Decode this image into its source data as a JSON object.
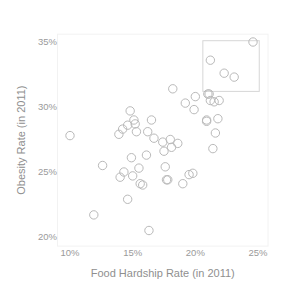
{
  "chart_data": {
    "type": "scatter",
    "title": "",
    "xlabel": "Food Hardship Rate (in 2011)",
    "ylabel": "Obesity Rate (in 2011)",
    "xlim": [
      9.0,
      25.8
    ],
    "ylim": [
      19.3,
      35.6
    ],
    "xticks": [
      10,
      15,
      20,
      25
    ],
    "xtick_labels": [
      "10%",
      "15%",
      "20%",
      "25%"
    ],
    "yticks": [
      20,
      25,
      30,
      35
    ],
    "ytick_labels": [
      "20%",
      "25%",
      "30%",
      "35%"
    ],
    "grid": false,
    "legend": null,
    "marker": {
      "shape": "open-circle",
      "color": "#b9b9b9",
      "size": 4.2
    },
    "annotations": [
      {
        "kind": "rectangle",
        "name": "highlight-box",
        "x0": 20.6,
        "x1": 25.1,
        "y0": 31.2,
        "y1": 35.1,
        "color": "#d6d6d6"
      }
    ],
    "points": [
      {
        "x": 10.0,
        "y": 27.8
      },
      {
        "x": 11.9,
        "y": 21.7
      },
      {
        "x": 12.6,
        "y": 25.5
      },
      {
        "x": 13.9,
        "y": 27.9
      },
      {
        "x": 14.0,
        "y": 24.6
      },
      {
        "x": 14.2,
        "y": 28.3
      },
      {
        "x": 14.3,
        "y": 25.0
      },
      {
        "x": 14.6,
        "y": 28.6
      },
      {
        "x": 14.6,
        "y": 22.9
      },
      {
        "x": 14.8,
        "y": 29.7
      },
      {
        "x": 14.9,
        "y": 26.1
      },
      {
        "x": 15.0,
        "y": 24.7
      },
      {
        "x": 15.1,
        "y": 29.0
      },
      {
        "x": 15.2,
        "y": 28.7
      },
      {
        "x": 15.3,
        "y": 28.1
      },
      {
        "x": 15.5,
        "y": 25.3
      },
      {
        "x": 15.6,
        "y": 24.1
      },
      {
        "x": 15.8,
        "y": 24.0
      },
      {
        "x": 16.1,
        "y": 26.3
      },
      {
        "x": 16.2,
        "y": 28.1
      },
      {
        "x": 16.3,
        "y": 20.5
      },
      {
        "x": 16.5,
        "y": 29.0
      },
      {
        "x": 16.7,
        "y": 27.6
      },
      {
        "x": 17.4,
        "y": 27.3
      },
      {
        "x": 17.5,
        "y": 26.6
      },
      {
        "x": 17.6,
        "y": 25.4
      },
      {
        "x": 17.7,
        "y": 24.4
      },
      {
        "x": 17.8,
        "y": 24.4
      },
      {
        "x": 18.0,
        "y": 27.5
      },
      {
        "x": 18.1,
        "y": 26.9
      },
      {
        "x": 18.2,
        "y": 31.4
      },
      {
        "x": 18.6,
        "y": 27.2
      },
      {
        "x": 19.0,
        "y": 24.1
      },
      {
        "x": 19.2,
        "y": 30.3
      },
      {
        "x": 19.5,
        "y": 24.8
      },
      {
        "x": 19.8,
        "y": 24.9
      },
      {
        "x": 19.9,
        "y": 29.8
      },
      {
        "x": 20.0,
        "y": 30.8
      },
      {
        "x": 20.9,
        "y": 29.0
      },
      {
        "x": 20.9,
        "y": 28.9
      },
      {
        "x": 21.0,
        "y": 31.0
      },
      {
        "x": 21.1,
        "y": 31.0
      },
      {
        "x": 21.2,
        "y": 30.5
      },
      {
        "x": 21.2,
        "y": 33.6
      },
      {
        "x": 21.4,
        "y": 26.8
      },
      {
        "x": 21.5,
        "y": 30.4
      },
      {
        "x": 21.6,
        "y": 28.0
      },
      {
        "x": 21.8,
        "y": 29.1
      },
      {
        "x": 21.9,
        "y": 30.5
      },
      {
        "x": 22.3,
        "y": 32.6
      },
      {
        "x": 23.1,
        "y": 32.3
      },
      {
        "x": 24.6,
        "y": 35.0
      }
    ]
  }
}
